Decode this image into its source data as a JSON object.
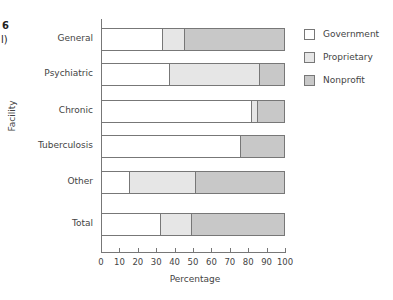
{
  "caption_fragments": {
    "line1": "6",
    "line2": "l)"
  },
  "colors": {
    "Government": "#ffffff",
    "Proprietary": "#e6e6e6",
    "Nonprofit": "#c8c8c8",
    "border": "#777777"
  },
  "chart_data": {
    "type": "bar",
    "orientation": "horizontal",
    "stacked": true,
    "title": "",
    "xlabel": "Percentage",
    "ylabel": "Facility",
    "xlim": [
      0,
      100
    ],
    "xticks": [
      0,
      10,
      20,
      30,
      40,
      50,
      60,
      70,
      80,
      90,
      100
    ],
    "categories": [
      "General",
      "Psychiatric",
      "Chronic",
      "Tuberculosis",
      "Other",
      "Total"
    ],
    "series": [
      {
        "name": "Government",
        "values": [
          33,
          37,
          82,
          76,
          15,
          32
        ]
      },
      {
        "name": "Proprietary",
        "values": [
          12,
          49,
          3,
          0,
          36,
          17
        ]
      },
      {
        "name": "Nonprofit",
        "values": [
          55,
          14,
          15,
          24,
          49,
          51
        ]
      }
    ],
    "legend": {
      "position": "right",
      "entries": [
        "Government",
        "Proprietary",
        "Nonprofit"
      ]
    },
    "grid": false
  }
}
